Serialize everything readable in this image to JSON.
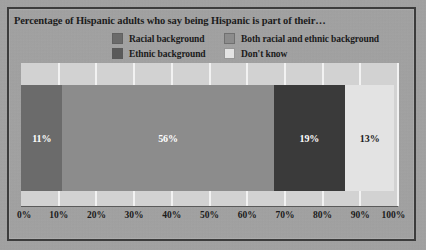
{
  "chart_data": {
    "type": "bar",
    "orientation": "horizontal-stacked",
    "title": "Percentage of Hispanic adults who say being Hispanic is part of their…",
    "xlabel": "",
    "ylabel": "",
    "xlim": [
      0,
      100
    ],
    "xticks": [
      "0%",
      "10%",
      "20%",
      "30%",
      "40%",
      "50%",
      "60%",
      "70%",
      "80%",
      "90%",
      "100%"
    ],
    "grid": true,
    "legend_position": "top",
    "categories": [
      "Racial background",
      "Ethnic background",
      "Both racial and ethnic background",
      "Don't know"
    ],
    "segments": [
      {
        "name": "Racial background",
        "value": 11,
        "label": "11%",
        "color": "#6b6b6b",
        "text_color": "#ffffff"
      },
      {
        "name": "Ethnic background",
        "value": 56,
        "label": "56%",
        "color": "#8c8c8c",
        "text_color": "#ffffff"
      },
      {
        "name": "Both racial and ethnic background",
        "value": 19,
        "label": "19%",
        "color": "#3a3a3a",
        "text_color": "#ffffff"
      },
      {
        "name": "Don't know",
        "value": 13,
        "label": "13%",
        "color": "#e3e3e3",
        "text_color": "#1b1b1b"
      }
    ]
  },
  "legend": {
    "items": [
      {
        "label": "Racial background",
        "color": "#6b6b6b"
      },
      {
        "label": "Both racial and ethnic background",
        "color": "#8c8c8c"
      },
      {
        "label": "Ethnic background",
        "color": "#5a5a5a"
      },
      {
        "label": "Don't know",
        "color": "#e3e3e3"
      }
    ]
  },
  "colors": {
    "plot_background": "#d2d2d2",
    "figure_background": "#a3a3a3",
    "gridline": "#f2f2f2",
    "frame": "#3c3c3c",
    "text": "#1b1b1b"
  }
}
